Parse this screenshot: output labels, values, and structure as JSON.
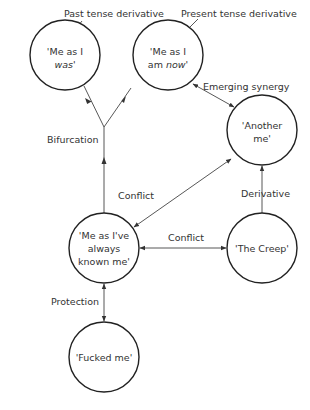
{
  "diagram": {
    "nodes": [
      {
        "id": "was",
        "lines": [
          "'Me as I",
          "was'"
        ],
        "italic_line": 1,
        "cx": 65,
        "cy": 55
      },
      {
        "id": "now",
        "lines": [
          "'Me as I",
          "am now'"
        ],
        "italic_word": "now",
        "cx": 168,
        "cy": 55
      },
      {
        "id": "another",
        "lines": [
          "'Another",
          "me'"
        ],
        "cx": 262,
        "cy": 130
      },
      {
        "id": "known",
        "lines": [
          "'Me as I've",
          "always",
          "known me'"
        ],
        "cx": 104,
        "cy": 248
      },
      {
        "id": "creep",
        "lines": [
          "'The Creep'"
        ],
        "cx": 262,
        "cy": 248
      },
      {
        "id": "fucked",
        "lines": [
          "'Fucked me'"
        ],
        "cx": 104,
        "cy": 357
      }
    ],
    "labels": {
      "past": "Past tense derivative",
      "present": "Present tense derivative",
      "emerging": "Emerging synergy",
      "bifurcation": "Bifurcation",
      "conflict1": "Conflict",
      "conflict2": "Conflict",
      "derivative": "Derivative",
      "protection": "Protection"
    },
    "node_text": {
      "was_1": "'Me as I",
      "was_2": "was'",
      "now_1": "'Me as I",
      "now_2a": "am ",
      "now_2b": "now",
      "now_2c": "'",
      "another_1": "'Another",
      "another_2": "me'",
      "known_1": "'Me as I've",
      "known_2": "always",
      "known_3": "known me'",
      "creep_1": "'The Creep'",
      "fucked_1": "'Fucked me'"
    },
    "edges": [
      {
        "from": "known",
        "to": "fork",
        "label": "Bifurcation",
        "type": "arrow"
      },
      {
        "from": "fork",
        "to": "was",
        "type": "arrow"
      },
      {
        "from": "fork",
        "to": "now",
        "type": "arrow"
      },
      {
        "from": "now",
        "to": "another",
        "label": "Emerging synergy",
        "type": "bidirectional"
      },
      {
        "from": "known",
        "to": "another",
        "label": "Conflict",
        "type": "bidirectional"
      },
      {
        "from": "known",
        "to": "creep",
        "label": "Conflict",
        "type": "bidirectional"
      },
      {
        "from": "creep",
        "to": "another",
        "label": "Derivative",
        "type": "arrow"
      },
      {
        "from": "known",
        "to": "fucked",
        "label": "Protection",
        "type": "bidirectional"
      }
    ],
    "colors": {
      "stroke": "#222222",
      "text": "#333333",
      "background": "#ffffff"
    }
  }
}
